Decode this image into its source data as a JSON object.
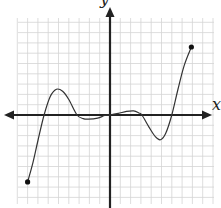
{
  "chart_data": {
    "type": "line",
    "title": "",
    "xlabel": "x",
    "ylabel": "y",
    "grid": true,
    "xlim": [
      -10,
      10
    ],
    "ylim": [
      -9,
      11
    ],
    "grid_step": 1,
    "tick_labels": false,
    "series": [
      {
        "name": "f(x)",
        "color": "#333333",
        "closed_endpoints": [
          [
            -8,
            -6.5
          ],
          [
            7.9,
            6.6
          ]
        ],
        "points": [
          [
            -8.0,
            -6.5
          ],
          [
            -7.5,
            -4.7
          ],
          [
            -7.0,
            -2.5
          ],
          [
            -6.4,
            0.0
          ],
          [
            -5.8,
            1.8
          ],
          [
            -5.2,
            2.5
          ],
          [
            -4.6,
            2.3
          ],
          [
            -4.0,
            1.5
          ],
          [
            -3.2,
            0.0
          ],
          [
            -2.6,
            -0.35
          ],
          [
            -2.1,
            -0.4
          ],
          [
            -1.2,
            -0.3
          ],
          [
            -0.5,
            -0.05
          ],
          [
            0.0,
            0.0
          ],
          [
            0.8,
            0.15
          ],
          [
            1.6,
            0.35
          ],
          [
            2.3,
            0.4
          ],
          [
            2.8,
            0.2
          ],
          [
            3.1,
            0.0
          ],
          [
            3.8,
            -1.2
          ],
          [
            4.4,
            -2.1
          ],
          [
            4.9,
            -2.4
          ],
          [
            5.4,
            -1.8
          ],
          [
            6.0,
            0.0
          ],
          [
            6.6,
            2.5
          ],
          [
            7.2,
            4.8
          ],
          [
            7.9,
            6.6
          ]
        ]
      }
    ],
    "key_features": {
      "roots": [
        -6.4,
        -3.2,
        0,
        3.1,
        6.0
      ],
      "local_maxima": [
        [
          -5.2,
          2.5
        ],
        [
          2.3,
          0.4
        ]
      ],
      "local_minima": [
        [
          -2.1,
          -0.4
        ],
        [
          4.9,
          -2.4
        ]
      ]
    }
  },
  "axes": {
    "x_label": "x",
    "y_label": "y"
  },
  "colors": {
    "grid": "#d4d4d4",
    "axis": "#222222",
    "curve": "#333333"
  }
}
